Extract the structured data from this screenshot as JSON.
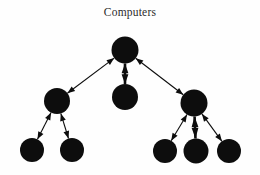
{
  "figure": {
    "title": "Computers",
    "background_color": "#fefefe",
    "ink_color": "#0d0d0d",
    "title_color": "#2b2b2b",
    "width": 260,
    "height": 175
  },
  "graph": {
    "type": "network-tree",
    "directed": "bidirectional",
    "node_count": 9,
    "edge_count": 8,
    "nodes": [
      {
        "id": "root",
        "label": "",
        "cx": 125,
        "cy": 50,
        "r": 13.5
      },
      {
        "id": "left-mid",
        "label": "",
        "cx": 57,
        "cy": 101,
        "r": 13.0
      },
      {
        "id": "center-mid",
        "label": "",
        "cx": 125,
        "cy": 97,
        "r": 13.0
      },
      {
        "id": "right-mid",
        "label": "",
        "cx": 194,
        "cy": 103,
        "r": 13.5
      },
      {
        "id": "leaf-1",
        "label": "",
        "cx": 32,
        "cy": 150,
        "r": 12.0
      },
      {
        "id": "leaf-2",
        "label": "",
        "cx": 72,
        "cy": 150,
        "r": 12.0
      },
      {
        "id": "leaf-3",
        "label": "",
        "cx": 165,
        "cy": 151,
        "r": 12.0
      },
      {
        "id": "leaf-4",
        "label": "",
        "cx": 196,
        "cy": 151,
        "r": 12.5
      },
      {
        "id": "leaf-5",
        "label": "",
        "cx": 229,
        "cy": 151,
        "r": 12.0
      }
    ],
    "edges": [
      {
        "id": "e-root-leftmid",
        "source": "root",
        "target": "left-mid",
        "arrow": "both"
      },
      {
        "id": "e-root-centermid",
        "source": "root",
        "target": "center-mid",
        "arrow": "both"
      },
      {
        "id": "e-root-rightmid",
        "source": "root",
        "target": "right-mid",
        "arrow": "both"
      },
      {
        "id": "e-leftmid-leaf1",
        "source": "left-mid",
        "target": "leaf-1",
        "arrow": "both"
      },
      {
        "id": "e-leftmid-leaf2",
        "source": "left-mid",
        "target": "leaf-2",
        "arrow": "both"
      },
      {
        "id": "e-rightmid-leaf3",
        "source": "right-mid",
        "target": "leaf-3",
        "arrow": "both"
      },
      {
        "id": "e-rightmid-leaf4",
        "source": "right-mid",
        "target": "leaf-4",
        "arrow": "both"
      },
      {
        "id": "e-rightmid-leaf5",
        "source": "right-mid",
        "target": "leaf-5",
        "arrow": "both"
      }
    ]
  }
}
